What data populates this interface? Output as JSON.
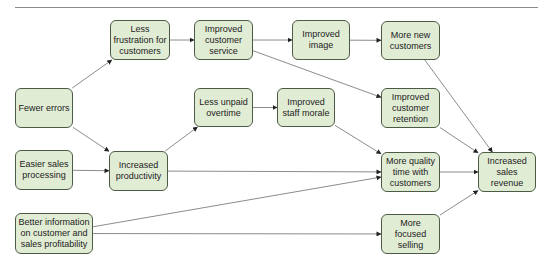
{
  "diagram": {
    "type": "flow-diagram",
    "colors": {
      "node_fill": "#e1ecd4",
      "node_border": "#4d5a45",
      "edge": "#8c8c8c",
      "arrow": "#222222"
    },
    "nodes": [
      {
        "id": "less_frustration",
        "label": "Less frustration for customers",
        "x": 110,
        "y": 20,
        "w": 60,
        "h": 40
      },
      {
        "id": "improved_service",
        "label": "Improved customer service",
        "x": 194,
        "y": 20,
        "w": 59,
        "h": 40
      },
      {
        "id": "improved_image",
        "label": "Improved image",
        "x": 292,
        "y": 20,
        "w": 58,
        "h": 40
      },
      {
        "id": "more_new_customers",
        "label": "More new customers",
        "x": 381,
        "y": 21,
        "w": 59,
        "h": 39
      },
      {
        "id": "fewer_errors",
        "label": "Fewer errors",
        "x": 15,
        "y": 88,
        "w": 58,
        "h": 40
      },
      {
        "id": "less_unpaid_overtime",
        "label": "Less unpaid overtime",
        "x": 194,
        "y": 88,
        "w": 59,
        "h": 39
      },
      {
        "id": "improved_staff_morale",
        "label": "Improved staff morale",
        "x": 277,
        "y": 88,
        "w": 58,
        "h": 39
      },
      {
        "id": "improved_retention",
        "label": "Improved customer retention",
        "x": 381,
        "y": 88,
        "w": 59,
        "h": 40
      },
      {
        "id": "easier_sales",
        "label": "Easier sales processing",
        "x": 15,
        "y": 150,
        "w": 58,
        "h": 40
      },
      {
        "id": "increased_productivity",
        "label": "Increased productivity",
        "x": 109,
        "y": 151,
        "w": 59,
        "h": 40
      },
      {
        "id": "more_quality_time",
        "label": "More quality time with customers",
        "x": 381,
        "y": 152,
        "w": 59,
        "h": 40
      },
      {
        "id": "increased_revenue",
        "label": "Increased sales revenue",
        "x": 478,
        "y": 152,
        "w": 58,
        "h": 40
      },
      {
        "id": "better_information",
        "label": "Better information on customer and sales profitability",
        "x": 15,
        "y": 213,
        "w": 78,
        "h": 41
      },
      {
        "id": "more_focused_selling",
        "label": "More focused selling",
        "x": 381,
        "y": 214,
        "w": 59,
        "h": 40
      }
    ],
    "edges": [
      {
        "from": "fewer_errors",
        "to": "less_frustration"
      },
      {
        "from": "fewer_errors",
        "to": "increased_productivity"
      },
      {
        "from": "less_frustration",
        "to": "improved_service"
      },
      {
        "from": "improved_service",
        "to": "improved_image"
      },
      {
        "from": "improved_service",
        "to": "improved_retention"
      },
      {
        "from": "improved_image",
        "to": "more_new_customers"
      },
      {
        "from": "more_new_customers",
        "to": "increased_revenue"
      },
      {
        "from": "easier_sales",
        "to": "increased_productivity"
      },
      {
        "from": "increased_productivity",
        "to": "less_unpaid_overtime"
      },
      {
        "from": "increased_productivity",
        "to": "more_quality_time"
      },
      {
        "from": "less_unpaid_overtime",
        "to": "improved_staff_morale"
      },
      {
        "from": "improved_staff_morale",
        "to": "more_quality_time"
      },
      {
        "from": "improved_retention",
        "to": "increased_revenue"
      },
      {
        "from": "more_quality_time",
        "to": "increased_revenue"
      },
      {
        "from": "better_information",
        "to": "more_quality_time"
      },
      {
        "from": "better_information",
        "to": "more_focused_selling"
      },
      {
        "from": "more_focused_selling",
        "to": "increased_revenue"
      }
    ]
  }
}
